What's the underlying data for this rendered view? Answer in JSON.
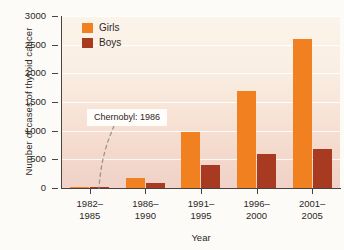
{
  "chart_data": {
    "type": "bar",
    "title": "",
    "xlabel": "Year",
    "ylabel": "Number of cases of thyroid cancer",
    "categories": [
      "1982–\n1985",
      "1986–\n1990",
      "1991–\n1995",
      "1996–\n2000",
      "2001–\n2005"
    ],
    "category_lines": [
      [
        "1982–",
        "1985"
      ],
      [
        "1986–",
        "1990"
      ],
      [
        "1991–",
        "1995"
      ],
      [
        "1996–",
        "2000"
      ],
      [
        "2001–",
        "2005"
      ]
    ],
    "series": [
      {
        "name": "Girls",
        "color": "#f08020",
        "values": [
          25,
          180,
          980,
          1700,
          2600
        ]
      },
      {
        "name": "Boys",
        "color": "#a83a22",
        "values": [
          15,
          90,
          400,
          600,
          680
        ]
      }
    ],
    "ylim": [
      0,
      3000
    ],
    "ytick_values": [
      0,
      500,
      1000,
      1500,
      2000,
      2500,
      3000
    ],
    "ytick_labels": [
      "0",
      "500",
      "1000",
      "1500",
      "2000",
      "2500",
      "3000"
    ],
    "grid": true,
    "legend_position": "top-left",
    "annotations": [
      {
        "text": "Chernobyl: 1986",
        "target_category": "1986–1990",
        "leader": "curved-dashed"
      }
    ]
  }
}
